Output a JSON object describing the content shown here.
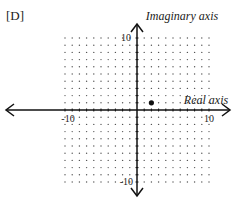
{
  "option_label": "[D]",
  "chart_data": {
    "type": "scatter",
    "title": "",
    "xlabel": "Real axis",
    "ylabel": "Imaginary axis",
    "xlim": [
      -10,
      10
    ],
    "ylim": [
      -10,
      10
    ],
    "grid": "dot",
    "x_tick_labels": [
      "-10",
      "10"
    ],
    "y_tick_labels": [
      "10",
      "-10"
    ],
    "points": [
      {
        "x": 2,
        "y": 1
      }
    ],
    "colors": {
      "axis": "#111111",
      "grid": "#555555",
      "point": "#111111"
    }
  }
}
